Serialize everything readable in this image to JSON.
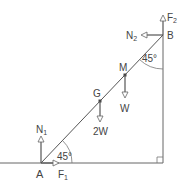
{
  "diagram": {
    "type": "ladder-statics",
    "colors": {
      "line": "#555555",
      "text": "#444444",
      "background": "#ffffff"
    },
    "points": {
      "A": {
        "label": "A"
      },
      "B": {
        "label": "B"
      },
      "G": {
        "label": "G"
      },
      "M": {
        "label": "M"
      }
    },
    "forces": {
      "N1": {
        "main": "N",
        "sub": "1"
      },
      "F1": {
        "main": "F",
        "sub": "1"
      },
      "N2": {
        "main": "N",
        "sub": "2"
      },
      "F2": {
        "main": "F",
        "sub": "2"
      },
      "W": {
        "label": "W"
      },
      "W2": {
        "label": "2W"
      }
    },
    "angles": {
      "at_A": "45°",
      "at_B": "45°"
    }
  }
}
